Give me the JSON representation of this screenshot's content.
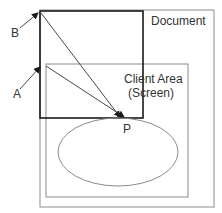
{
  "diagram": {
    "labels": {
      "document": "Document",
      "client_area_line1": "Client Area",
      "client_area_line2": "(Screen)",
      "point_a": "A",
      "point_b": "B",
      "point_p": "P"
    },
    "colors": {
      "stroke_dark": "#1a1a1a",
      "stroke_gray": "#8c8c8c",
      "text": "#333333",
      "background": "#ffffff"
    }
  }
}
